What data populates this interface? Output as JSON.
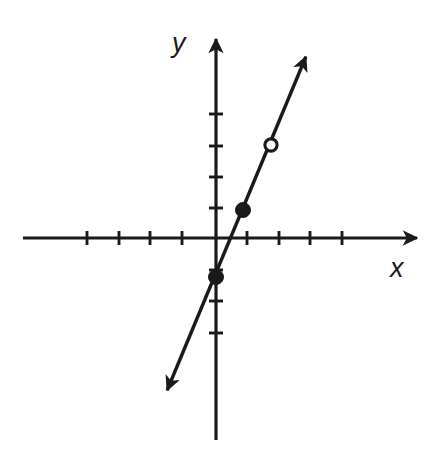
{
  "figure": {
    "type": "coordinate-plane-line-graph",
    "background_color": "#ffffff",
    "stroke_color": "#1a1a1a",
    "width": 448,
    "height": 453
  },
  "axes": {
    "x_label": "x",
    "y_label": "y",
    "origin_px": {
      "x": 216,
      "y": 238
    },
    "unit_px": 31.5,
    "x_axis": {
      "start_px": 23,
      "end_px": 425,
      "arrow": "right",
      "tick_positions_px": [
        87,
        119,
        150,
        182,
        247,
        279,
        310,
        342
      ],
      "tick_values": [
        -4,
        -3,
        -2,
        -1,
        1,
        2,
        3,
        4
      ],
      "tick_labels_shown": false,
      "tick_length_px": 14
    },
    "y_axis": {
      "start_px": 440,
      "end_px": 31,
      "arrow": "up",
      "tick_positions_px": [
        114,
        146,
        177,
        208,
        270,
        301,
        333
      ],
      "tick_values": [
        4,
        3,
        2,
        1,
        -1,
        -2,
        -3
      ],
      "tick_labels_shown": false,
      "tick_length_px": 14
    },
    "grid": false,
    "axis_line_width_px": 3.2
  },
  "chart_data": {
    "type": "line",
    "title": "",
    "subtitle": "",
    "xlabel": "x",
    "ylabel": "y",
    "xlim": [
      -6.1,
      6.6
    ],
    "ylim": [
      -6.4,
      6.6
    ],
    "grid": false,
    "legend": false,
    "x_ticks": [
      -4,
      -3,
      -2,
      -1,
      1,
      2,
      3,
      4
    ],
    "y_ticks": [
      -4,
      -3,
      -2,
      -1,
      1,
      2,
      3,
      4
    ],
    "tick_labels_shown": false,
    "series": [
      {
        "name": "line",
        "kind": "line-segment-with-arrows",
        "equation_slope": 2.4,
        "equation_intercept": -1.25,
        "endpoints_px": [
          {
            "x": 161,
            "y": 405
          },
          {
            "x": 312,
            "y": 42
          }
        ],
        "endpoints_data": [
          {
            "x": -1.75,
            "y": -5.3
          },
          {
            "x": 3.05,
            "y": 6.22
          }
        ],
        "arrow_start": true,
        "arrow_end": true,
        "line_width_px": 3.4
      }
    ],
    "points": [
      {
        "label": "closed-point-lower",
        "style": "filled",
        "px": {
          "x": 216,
          "y": 277
        },
        "data": {
          "x": 0,
          "y": -1.25
        },
        "radius_px": 7.5
      },
      {
        "label": "closed-point-upper",
        "style": "filled",
        "px": {
          "x": 243,
          "y": 210
        },
        "data": {
          "x": 0.86,
          "y": 0.89
        },
        "radius_px": 7.5
      },
      {
        "label": "open-point",
        "style": "open",
        "px": {
          "x": 271,
          "y": 145
        },
        "data": {
          "x": 1.75,
          "y": 2.95
        },
        "radius_px": 7
      }
    ]
  }
}
